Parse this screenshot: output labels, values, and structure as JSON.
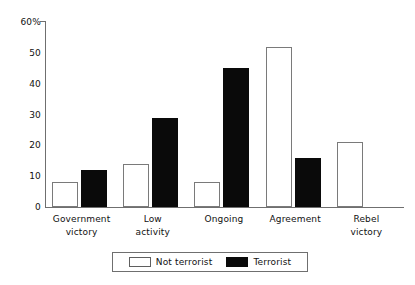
{
  "chart_data": {
    "type": "bar",
    "title": "",
    "subtitle": "",
    "xlabel": "",
    "ylabel": "",
    "ylim": [
      0,
      60
    ],
    "yticks": [
      0,
      10,
      20,
      30,
      40,
      50,
      60
    ],
    "ytick_labels": [
      "0",
      "10",
      "20",
      "30",
      "40",
      "50",
      "60%"
    ],
    "grid": false,
    "legend_position": "bottom-center",
    "categories": [
      "Government victory",
      "Low activity",
      "Ongoing",
      "Agreement",
      "Rebel victory"
    ],
    "category_lines": [
      [
        "Government",
        "victory"
      ],
      [
        "Low",
        "activity"
      ],
      [
        "Ongoing"
      ],
      [
        "Agreement"
      ],
      [
        "Rebel",
        "victory"
      ]
    ],
    "series": [
      {
        "name": "Not terrorist",
        "style": "light",
        "color": "#ffffff",
        "edge_color": "#7a7a7a",
        "values": [
          8,
          14,
          8,
          52,
          21
        ]
      },
      {
        "name": "Terrorist",
        "style": "dark",
        "color": "#0a0a0a",
        "edge_color": "#0a0a0a",
        "values": [
          12,
          29,
          45,
          16,
          null
        ]
      }
    ],
    "annotations": []
  },
  "legend": {
    "entries": [
      {
        "label": "Not terrorist",
        "style": "light"
      },
      {
        "label": "Terrorist",
        "style": "dark"
      }
    ]
  },
  "axis": {
    "line_color": "#6f6f6f"
  }
}
